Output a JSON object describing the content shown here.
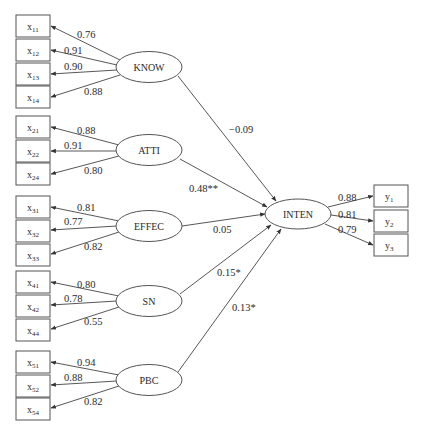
{
  "diagram": {
    "type": "structural-equation-model",
    "latents": [
      {
        "id": "KNOW",
        "label": "KNOW",
        "cx": 149,
        "cy": 67
      },
      {
        "id": "ATTI",
        "label": "ATTI",
        "cx": 149,
        "cy": 150
      },
      {
        "id": "EFFEC",
        "label": "EFFEC",
        "cx": 149,
        "cy": 226
      },
      {
        "id": "SN",
        "label": "SN",
        "cx": 149,
        "cy": 301
      },
      {
        "id": "PBC",
        "label": "PBC",
        "cx": 149,
        "cy": 380
      },
      {
        "id": "INTEN",
        "label": "INTEN",
        "cx": 298,
        "cy": 214
      }
    ],
    "indicators": [
      {
        "base": "x",
        "sub": "11",
        "latent": "KNOW",
        "loading": "0.76"
      },
      {
        "base": "x",
        "sub": "12",
        "latent": "KNOW",
        "loading": "0.91"
      },
      {
        "base": "x",
        "sub": "13",
        "latent": "KNOW",
        "loading": "0.90"
      },
      {
        "base": "x",
        "sub": "14",
        "latent": "KNOW",
        "loading": "0.88"
      },
      {
        "base": "x",
        "sub": "21",
        "latent": "ATTI",
        "loading": "0.88"
      },
      {
        "base": "x",
        "sub": "22",
        "latent": "ATTI",
        "loading": "0.91"
      },
      {
        "base": "x",
        "sub": "24",
        "latent": "ATTI",
        "loading": "0.80"
      },
      {
        "base": "x",
        "sub": "31",
        "latent": "EFFEC",
        "loading": "0.81"
      },
      {
        "base": "x",
        "sub": "32",
        "latent": "EFFEC",
        "loading": "0.77"
      },
      {
        "base": "x",
        "sub": "33",
        "latent": "EFFEC",
        "loading": "0.82"
      },
      {
        "base": "x",
        "sub": "41",
        "latent": "SN",
        "loading": "0.80"
      },
      {
        "base": "x",
        "sub": "42",
        "latent": "SN",
        "loading": "0.78"
      },
      {
        "base": "x",
        "sub": "44",
        "latent": "SN",
        "loading": "0.55"
      },
      {
        "base": "x",
        "sub": "51",
        "latent": "PBC",
        "loading": "0.94"
      },
      {
        "base": "x",
        "sub": "52",
        "latent": "PBC",
        "loading": "0.88"
      },
      {
        "base": "x",
        "sub": "54",
        "latent": "PBC",
        "loading": "0.82"
      },
      {
        "base": "y",
        "sub": "1",
        "latent": "INTEN",
        "loading": "0.88"
      },
      {
        "base": "y",
        "sub": "2",
        "latent": "INTEN",
        "loading": "0.81"
      },
      {
        "base": "y",
        "sub": "3",
        "latent": "INTEN",
        "loading": "0.79"
      }
    ],
    "paths": [
      {
        "from": "KNOW",
        "to": "INTEN",
        "coef": "−0.09"
      },
      {
        "from": "ATTI",
        "to": "INTEN",
        "coef": "0.48**"
      },
      {
        "from": "EFFEC",
        "to": "INTEN",
        "coef": "0.05"
      },
      {
        "from": "SN",
        "to": "INTEN",
        "coef": "0.15*"
      },
      {
        "from": "PBC",
        "to": "INTEN",
        "coef": "0.13*"
      }
    ]
  }
}
